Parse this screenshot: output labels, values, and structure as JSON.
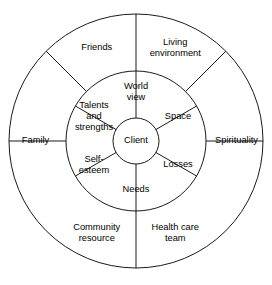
{
  "diagram": {
    "type": "concentric-wheel",
    "title": "Client",
    "geometry": {
      "center_x": 136,
      "center_y": 141,
      "outer_radius": 127,
      "middle_radius": 70,
      "inner_radius": 23
    },
    "stroke_color": "#000000",
    "background_color": "#ffffff",
    "center": {
      "label": "Client"
    },
    "inner_ring": {
      "segment_count": 6,
      "segments": [
        {
          "label_line1": "World",
          "label_line2": "view",
          "label_line3": "",
          "angle_deg": 90
        },
        {
          "label_line1": "Space",
          "label_line2": "",
          "label_line3": "",
          "angle_deg": 30
        },
        {
          "label_line1": "Losses",
          "label_line2": "",
          "label_line3": "",
          "angle_deg": 330
        },
        {
          "label_line1": "Needs",
          "label_line2": "",
          "label_line3": "",
          "angle_deg": 270
        },
        {
          "label_line1": "Self-",
          "label_line2": "esteem",
          "label_line3": "",
          "angle_deg": 210
        },
        {
          "label_line1": "Talents",
          "label_line2": "and",
          "label_line3": "strengths",
          "angle_deg": 150
        }
      ]
    },
    "outer_ring": {
      "segment_count": 6,
      "segments": [
        {
          "label_line1": "Living",
          "label_line2": "environment",
          "angle_deg": 67
        },
        {
          "label_line1": "Spirituality",
          "label_line2": "",
          "angle_deg": 0
        },
        {
          "label_line1": "Health care",
          "label_line2": "team",
          "angle_deg": 293
        },
        {
          "label_line1": "Community",
          "label_line2": "resource",
          "angle_deg": 247
        },
        {
          "label_line1": "Family",
          "label_line2": "",
          "angle_deg": 180
        },
        {
          "label_line1": "Friends",
          "label_line2": "",
          "angle_deg": 113
        }
      ]
    },
    "inner_spoke_angles_deg": [
      30,
      90,
      150,
      210,
      270,
      330
    ],
    "outer_spoke_angles_deg": [
      0,
      45,
      90,
      135,
      180,
      270
    ]
  }
}
